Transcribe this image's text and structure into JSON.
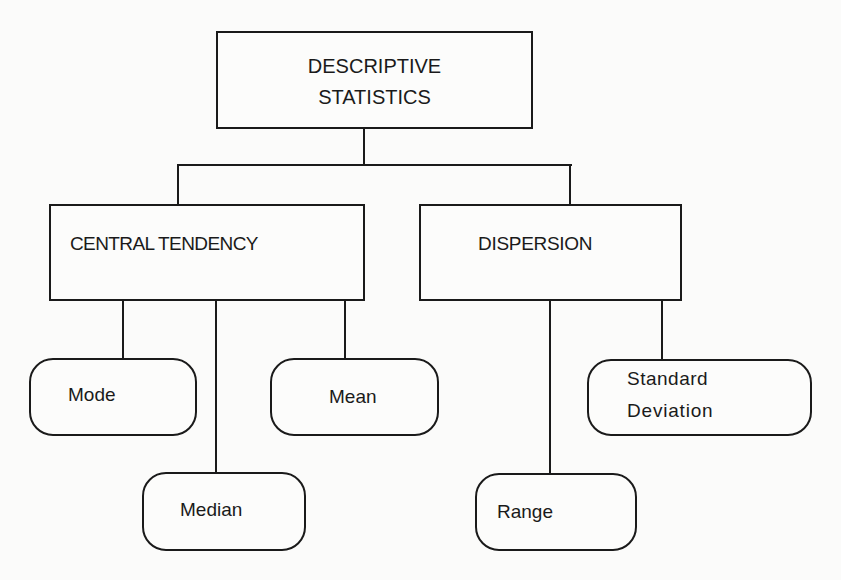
{
  "diagram": {
    "root": {
      "label_line1": "DESCRIPTIVE",
      "label_line2": "STATISTICS"
    },
    "branches": [
      {
        "label": "CENTRAL TENDENCY",
        "children": [
          "Mode",
          "Median",
          "Mean"
        ]
      },
      {
        "label": "DISPERSION",
        "children": [
          "Range",
          "Standard Deviation"
        ]
      }
    ],
    "nodes": {
      "mode": "Mode",
      "median": "Median",
      "mean": "Mean",
      "range": "Range",
      "sd_line1": "Standard",
      "sd_line2": "Deviation"
    },
    "colors": {
      "stroke": "#1a1a1a",
      "background": "#fbfbfa"
    }
  }
}
